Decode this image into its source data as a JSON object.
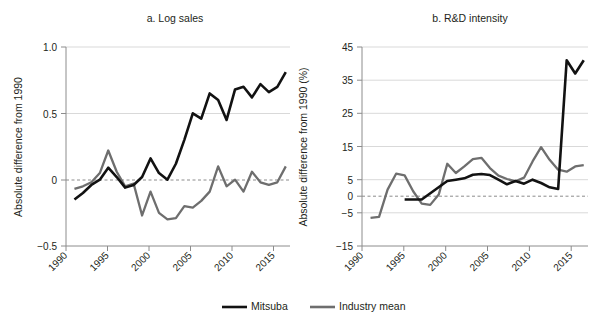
{
  "figure": {
    "background": "#ffffff",
    "series_colors": {
      "mitsuba": "#121212",
      "industry_mean": "#6e6e6e"
    }
  },
  "legend": {
    "items": [
      {
        "label": "Mitsuba",
        "color": "#121212",
        "key": "mitsuba-legend"
      },
      {
        "label": "Industry mean",
        "color": "#6e6e6e",
        "key": "industry-mean-legend"
      }
    ]
  },
  "chart_data": [
    {
      "type": "line",
      "panel": "a",
      "title": "a. Log sales",
      "xlabel": "",
      "ylabel": "Absolute difference from 1990",
      "xlim": [
        1990,
        2016.5
      ],
      "ylim": [
        -0.5,
        1.0
      ],
      "xticks": [
        1990,
        1995,
        2000,
        2005,
        2010,
        2015
      ],
      "xticklabels": [
        "1990",
        "1995",
        "2000",
        "2005",
        "2010",
        "2015"
      ],
      "yticks": [
        -0.5,
        0,
        0.5,
        1.0
      ],
      "yticklabels": [
        "−0.5",
        "0",
        "0.5",
        "1.0"
      ],
      "gridlines_y": [
        0.5,
        1.0
      ],
      "zero_reference": 0,
      "legend_position": "bottom-center",
      "series": [
        {
          "name": "Mitsuba",
          "color": "#121212",
          "x": [
            1991,
            1992,
            1993,
            1994,
            1995,
            1996,
            1997,
            1998,
            1999,
            2000,
            2001,
            2002,
            2003,
            2004,
            2005,
            2006,
            2007,
            2008,
            2009,
            2010,
            2011,
            2012,
            2013,
            2014,
            2015,
            2016
          ],
          "values": [
            -0.15,
            -0.1,
            -0.04,
            0.0,
            0.09,
            0.02,
            -0.06,
            -0.04,
            0.02,
            0.16,
            0.05,
            0.0,
            0.12,
            0.3,
            0.5,
            0.46,
            0.65,
            0.6,
            0.45,
            0.68,
            0.7,
            0.62,
            0.72,
            0.66,
            0.7,
            0.81
          ]
        },
        {
          "name": "Industry mean",
          "color": "#6e6e6e",
          "x": [
            1991,
            1992,
            1993,
            1994,
            1995,
            1996,
            1997,
            1998,
            1999,
            2000,
            2001,
            2002,
            2003,
            2004,
            2005,
            2006,
            2007,
            2008,
            2009,
            2010,
            2011,
            2012,
            2013,
            2014,
            2015,
            2016
          ],
          "values": [
            -0.07,
            -0.05,
            -0.02,
            0.05,
            0.22,
            0.06,
            -0.05,
            -0.03,
            -0.27,
            -0.09,
            -0.25,
            -0.3,
            -0.29,
            -0.2,
            -0.21,
            -0.16,
            -0.09,
            0.1,
            -0.05,
            0.0,
            -0.09,
            0.06,
            -0.02,
            -0.04,
            -0.02,
            0.1
          ]
        }
      ]
    },
    {
      "type": "line",
      "panel": "b",
      "title": "b. R&D intensity",
      "xlabel": "",
      "ylabel": "Absolute difference from 1990 (%)",
      "xlim": [
        1990,
        2016.5
      ],
      "ylim": [
        -15,
        45
      ],
      "xticks": [
        1990,
        1995,
        2000,
        2005,
        2010,
        2015
      ],
      "xticklabels": [
        "1990",
        "1995",
        "2000",
        "2005",
        "2010",
        "2015"
      ],
      "yticks": [
        -15,
        -5,
        0,
        5,
        15,
        25,
        35,
        45
      ],
      "yticklabels": [
        "−15",
        "−5",
        "0",
        "5",
        "15",
        "25",
        "35",
        "45"
      ],
      "gridlines_y": [
        -5,
        5,
        15,
        25,
        35,
        45
      ],
      "zero_reference": 0,
      "legend_position": "bottom-center",
      "series": [
        {
          "name": "Mitsuba",
          "color": "#121212",
          "x": [
            1995,
            1996,
            1997,
            2000,
            2001,
            2002,
            2003,
            2004,
            2005,
            2006,
            2007,
            2008,
            2009,
            2010,
            2011,
            2012,
            2013,
            2014,
            2015,
            2016
          ],
          "values": [
            -1.0,
            -1.0,
            -1.0,
            4.6,
            5.0,
            5.4,
            6.5,
            6.7,
            6.4,
            5.0,
            3.6,
            4.6,
            3.8,
            5.0,
            4.0,
            2.7,
            2.2,
            41.0,
            37.0,
            41.0
          ]
        },
        {
          "name": "Industry mean",
          "color": "#6e6e6e",
          "x": [
            1991,
            1992,
            1993,
            1994,
            1995,
            1996,
            1997,
            1998,
            1999,
            2000,
            2001,
            2002,
            2003,
            2004,
            2005,
            2006,
            2007,
            2008,
            2009,
            2010,
            2011,
            2012,
            2013,
            2014,
            2015,
            2016
          ],
          "values": [
            -6.5,
            -6.2,
            2.0,
            6.8,
            6.3,
            1.5,
            -2.2,
            -2.6,
            0.5,
            9.8,
            7.0,
            9.0,
            11.2,
            11.6,
            8.5,
            6.2,
            5.2,
            4.5,
            5.6,
            10.5,
            14.8,
            11.0,
            8.0,
            7.4,
            9.0,
            9.4
          ]
        }
      ]
    }
  ]
}
